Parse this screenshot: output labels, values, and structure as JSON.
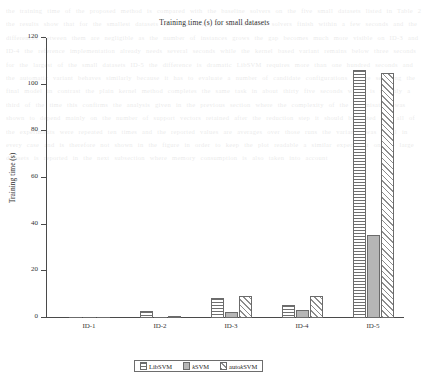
{
  "chart_data": {
    "type": "bar",
    "title": "Training time (s) for small datasets",
    "xlabel": "",
    "ylabel": "Training time (s)",
    "categories": [
      "ID-1",
      "ID-2",
      "ID-3",
      "ID-4",
      "ID-5"
    ],
    "series": [
      {
        "name": "LibSVM",
        "pattern": "horizontal-lines",
        "values": [
          0.3,
          2.8,
          8.5,
          5.6,
          106.3
        ]
      },
      {
        "name": "kSVM",
        "pattern": "solid-gray",
        "values": [
          0.15,
          0.5,
          2.7,
          3.6,
          35.5
        ]
      },
      {
        "name": "autokSVM",
        "pattern": "diagonal-hatch",
        "values": [
          0.1,
          0.6,
          9.6,
          9.4,
          104.8
        ]
      }
    ],
    "ylim": [
      0,
      120
    ],
    "yticks": [
      0,
      20,
      40,
      60,
      80,
      100,
      120
    ],
    "ytick_labels": [
      "0",
      "20",
      "40",
      "60",
      "80",
      "100",
      "120"
    ],
    "grid": false,
    "legend_position": "bottom-center"
  },
  "legend": {
    "items": [
      {
        "label_prefix": "",
        "label_italic": "",
        "label_suffix": "LibSVM",
        "swatch": "horizontal-lines-swatch"
      },
      {
        "label_prefix": "",
        "label_italic": "k",
        "label_suffix": "SVM",
        "swatch": "solid-gray-swatch"
      },
      {
        "label_prefix": "auto",
        "label_italic": "k",
        "label_suffix": "SVM",
        "swatch": "diagonal-hatch-swatch"
      }
    ]
  },
  "background": {
    "ghost_text": "the training time of the proposed method is compared with the baseline solvers on the five small datasets listed in Table 2 the results show that for the smallest datasets ID-1 and ID-2 all of the three solvers finish within a few seconds and the differences between them are negligible as the number of instances grows the gap becomes much more visible on ID-3 and ID-4 the reference implementation already needs several seconds while the kernel based variant remains below three seconds for the largest of the small datasets ID-5 the difference is dramatic LibSVM requires more than one hundred seconds and the automatic variant behaves similarly because it has to evaluate a number of candidate configurations before selecting the final model in contrast the plain kernel method completes the same task in about thirty five seconds which is roughly a third of the time this confirms the analysis given in the previous section where the complexity of the optimisation was shown to depend mainly on the number of support vectors retained after the reduction step it should be noted that all of the experiments were repeated ten times and the reported values are averages over those runs the variance was small in every case and is therefore not shown in the figure in order to keep the plot readable a similar experiment on the large datasets is reported in the next subsection where memory consumption is also taken into account"
  }
}
